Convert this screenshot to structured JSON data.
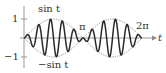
{
  "chart_data": {
    "type": "line",
    "title": "",
    "xlabel": "t",
    "ylabel": "",
    "x_range": [
      0,
      6.2832
    ],
    "ylim": [
      -1,
      1
    ],
    "grid": false,
    "x_tick_labels": [
      "π",
      "2π"
    ],
    "y_tick_labels": [
      "1",
      "−1"
    ],
    "series": [
      {
        "name": "sin t",
        "style": "dotted",
        "expr": "sin(t)",
        "role": "upper envelope"
      },
      {
        "name": "−sin t",
        "style": "dotted",
        "expr": "-sin(t)",
        "role": "lower envelope"
      },
      {
        "name": "sin t · sin 10t",
        "style": "solid",
        "expr": "sin(t)*sin(10*t)",
        "role": "modulated oscillation"
      }
    ],
    "annotations": [
      {
        "text": "sin t",
        "position": "above upper envelope peak"
      },
      {
        "text": "−sin t",
        "position": "below lower envelope trough"
      },
      {
        "text": "π",
        "position": "node at t = π"
      },
      {
        "text": "2π",
        "position": "node at t = 2π"
      }
    ]
  },
  "labels": {
    "sin_t": "sin t",
    "neg_sin_t": "−sin t",
    "pi": "π",
    "two_pi": "2π",
    "t_axis": "t",
    "y_one": "1",
    "y_neg_one": "−1"
  },
  "colors": {
    "curve": "#2a2a2a",
    "envelope": "#777777",
    "axis": "#888888",
    "text": "#333333"
  }
}
